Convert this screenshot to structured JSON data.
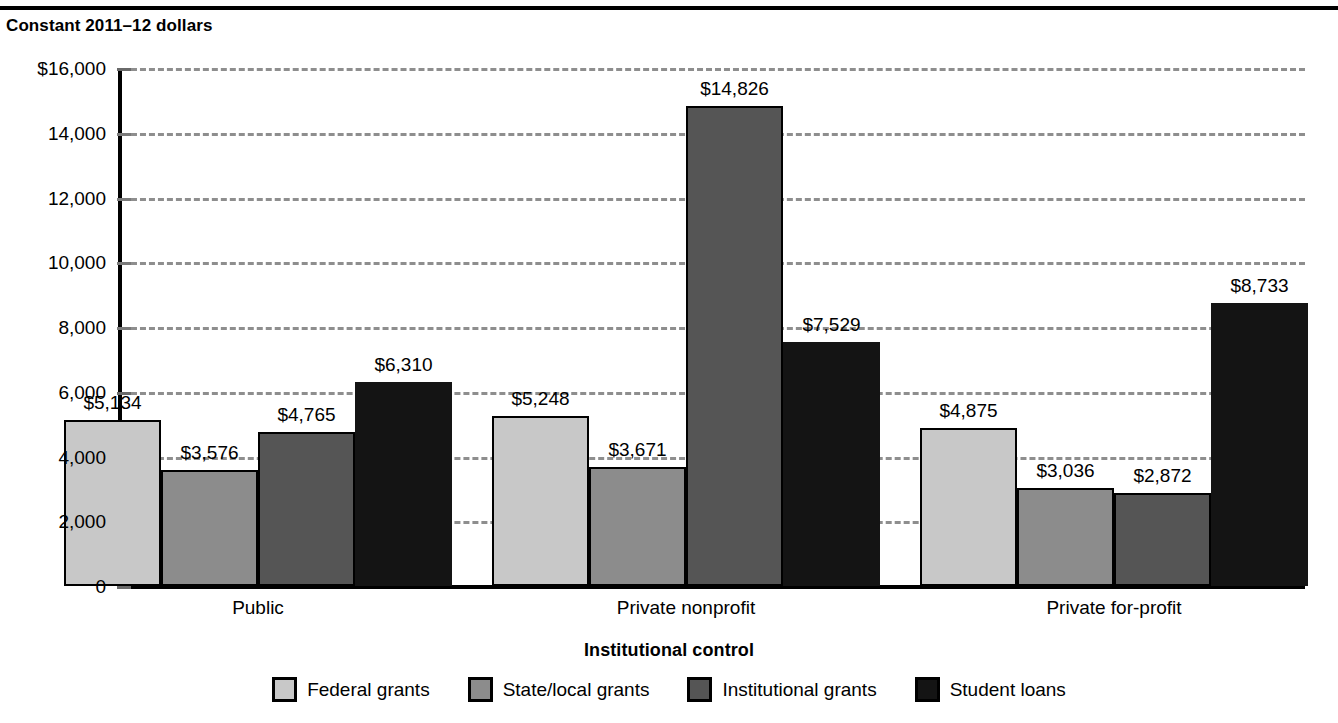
{
  "header": {
    "units_label": "Constant 2011–12 dollars"
  },
  "axes": {
    "x_title": "Institutional control",
    "y_ticks": [
      "$16,000",
      "14,000",
      "12,000",
      "10,000",
      "8,000",
      "6,000",
      "4,000",
      "2,000",
      "0"
    ],
    "category_labels": [
      "Public",
      "Private nonprofit",
      "Private for-profit"
    ]
  },
  "legend": {
    "items": [
      {
        "label": "Federal grants",
        "color": "#c8c8c8"
      },
      {
        "label": "State/local grants",
        "color": "#8c8c8c"
      },
      {
        "label": "Institutional grants",
        "color": "#555555"
      },
      {
        "label": "Student loans",
        "color": "#141414"
      }
    ]
  },
  "chart_data": {
    "type": "bar",
    "title": "Constant 2011–12 dollars",
    "xlabel": "Institutional control",
    "ylabel": "Constant 2011–12 dollars",
    "ylim": [
      0,
      16000
    ],
    "ytick_step": 2000,
    "grid": true,
    "legend_position": "bottom",
    "categories": [
      "Public",
      "Private nonprofit",
      "Private for-profit"
    ],
    "series": [
      {
        "name": "Federal grants",
        "color": "#c8c8c8",
        "values": [
          5134,
          5248,
          4875
        ],
        "labels": [
          "$5,134",
          "$5,248",
          "$4,875"
        ]
      },
      {
        "name": "State/local grants",
        "color": "#8c8c8c",
        "values": [
          3576,
          3671,
          3036
        ],
        "labels": [
          "$3,576",
          "$3,671",
          "$3,036"
        ]
      },
      {
        "name": "Institutional grants",
        "color": "#555555",
        "values": [
          4765,
          14826,
          2872
        ],
        "labels": [
          "$4,765",
          "$14,826",
          "$2,872"
        ]
      },
      {
        "name": "Student loans",
        "color": "#141414",
        "values": [
          6310,
          7529,
          8733
        ],
        "labels": [
          "$6,310",
          "$7,529",
          "$8,733"
        ]
      }
    ]
  },
  "layout": {
    "group_centers_px": [
      258,
      686,
      1114
    ],
    "bar_width_px": 97,
    "group_span_px": 388
  }
}
